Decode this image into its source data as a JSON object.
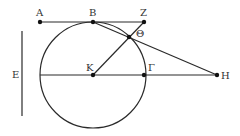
{
  "diagram": {
    "type": "geometric-construction",
    "stroke_color": "#2a2a2a",
    "points": {
      "A": {
        "label": "Α",
        "x": 40,
        "y": 22
      },
      "B": {
        "label": "Β",
        "x": 93,
        "y": 22
      },
      "Z": {
        "label": "Ζ",
        "x": 144,
        "y": 22
      },
      "Theta": {
        "label": "Θ",
        "x": 129,
        "y": 37
      },
      "K": {
        "label": "Κ",
        "x": 93,
        "y": 75
      },
      "Gamma": {
        "label": "Γ",
        "x": 144,
        "y": 75
      },
      "H": {
        "label": "Η",
        "x": 217,
        "y": 75
      }
    },
    "segment_E": {
      "label": "Ε",
      "x": 22,
      "y1": 31,
      "y2": 116
    },
    "circle": {
      "center": "K",
      "cx": 93,
      "cy": 75,
      "r": 53
    },
    "lines": [
      {
        "from": "A",
        "to": "Z"
      },
      {
        "from": "B",
        "to": "H"
      },
      {
        "from": "K",
        "to": "Z"
      },
      {
        "from": "K",
        "to": "H"
      }
    ]
  }
}
